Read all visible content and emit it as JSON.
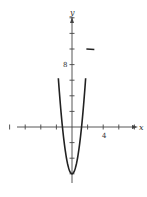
{
  "chart_data": {
    "type": "line",
    "title": "",
    "xlabel": "x",
    "ylabel": "y",
    "function": "y = 4x^2 - 6",
    "xlim": [
      -9.5,
      12
    ],
    "ylim": [
      -7.5,
      16
    ],
    "x_ticks": [
      -8,
      -6,
      -4,
      -2,
      2,
      4,
      6,
      8
    ],
    "y_ticks": [
      -6,
      -4,
      -2,
      2,
      4,
      6,
      8,
      10,
      12,
      14
    ],
    "tick_labels": {
      "x": [
        {
          "value": 4,
          "label": "4"
        }
      ],
      "y": [
        {
          "value": 8,
          "label": "8"
        }
      ]
    },
    "series": [
      {
        "name": "parabola",
        "x": [
          -2.3,
          -2,
          -1.5,
          -1.22,
          -1,
          -0.5,
          0,
          0.5,
          1,
          1.22,
          1.5,
          2,
          2.3
        ],
        "y": [
          15.16,
          10,
          3,
          0,
          -2,
          -5,
          -6,
          -5,
          -2,
          0,
          3,
          10,
          15.16
        ]
      }
    ],
    "annotations": [
      {
        "type": "arrow-marker",
        "x": 2,
        "y": 10
      }
    ],
    "vertex": [
      0,
      -6
    ],
    "x_intercepts": [
      -1.22,
      1.22
    ],
    "grid": false,
    "legend": null
  },
  "labels": {
    "x_axis": "x",
    "y_axis": "y",
    "x_tick_4": "4",
    "y_tick_8": "8"
  }
}
